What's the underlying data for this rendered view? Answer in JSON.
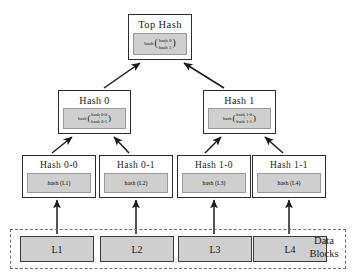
{
  "diagram": {
    "background_color": "#ffffff",
    "box_fill": "#ffffff",
    "formula_fill": "#cfcfcf",
    "border_color": "#2b2b2b",
    "dashed_border_color": "#6f6f6f"
  },
  "root": {
    "label": "Top Hash",
    "formula_fn": "hash",
    "formula_open": "(",
    "formula_close": ")",
    "operand_top": "hash 0",
    "operand_op": "+",
    "operand_bottom": "hash 1"
  },
  "level1": [
    {
      "label": "Hash 0",
      "formula_fn": "hash",
      "formula_open": "(",
      "formula_close": ")",
      "operand_top": "hash 0-0",
      "operand_op": "+",
      "operand_bottom": "hash 0-1"
    },
    {
      "label": "Hash 1",
      "formula_fn": "hash",
      "formula_open": "(",
      "formula_close": ")",
      "operand_top": "hash 1-0",
      "operand_op": "+",
      "operand_bottom": "hash 1-1"
    }
  ],
  "level2": [
    {
      "label": "Hash 0-0",
      "formula": "hash (L1)"
    },
    {
      "label": "Hash 0-1",
      "formula": "hash (L2)"
    },
    {
      "label": "Hash 1-0",
      "formula": "hash (L3)"
    },
    {
      "label": "Hash 1-1",
      "formula": "hash (L4)"
    }
  ],
  "data_blocks": {
    "label_line1": "Data",
    "label_line2": "Blocks",
    "blocks": [
      {
        "label": "L1"
      },
      {
        "label": "L2"
      },
      {
        "label": "L3"
      },
      {
        "label": "L4"
      }
    ]
  }
}
